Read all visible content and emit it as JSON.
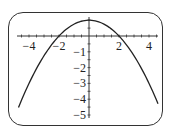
{
  "chart_data": {
    "type": "line",
    "title": "",
    "xlabel": "",
    "ylabel": "",
    "function": "y = 1 - x^2/4",
    "series": [
      {
        "name": "parabola",
        "x": [
          -4.7,
          -4,
          -3,
          -2,
          -1,
          0,
          1,
          2,
          3,
          4,
          4.6
        ],
        "y": [
          -4.52,
          -3,
          -1.25,
          0,
          0.75,
          1,
          0.75,
          0,
          -1.25,
          -3,
          -4.29
        ]
      }
    ],
    "xlim": [
      -4.8,
      5
    ],
    "ylim": [
      -5.3,
      1.1
    ],
    "x_ticks": [
      -4,
      -2,
      2,
      4
    ],
    "x_tick_labels": [
      "−4",
      "−2",
      "2",
      "4"
    ],
    "y_ticks": [
      -1,
      -2,
      -3,
      -4,
      -5
    ],
    "y_tick_labels": [
      "−1",
      "−2",
      "−3",
      "−4",
      "−5"
    ],
    "grid": false,
    "legend": "none",
    "colors": {
      "curve": "#222222",
      "axis": "#333333",
      "frame": "#333333"
    }
  }
}
